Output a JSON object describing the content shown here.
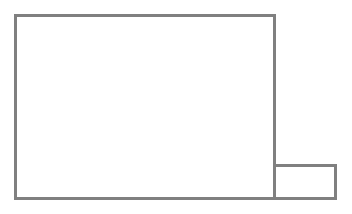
{
  "diagram": {
    "stroke_color": "#808080",
    "stroke_width": 3,
    "shapes": [
      {
        "name": "large-rectangle",
        "x": 14,
        "y": 14,
        "width": 262,
        "height": 186
      },
      {
        "name": "small-rectangle",
        "x": 273,
        "y": 164,
        "width": 64,
        "height": 36
      }
    ]
  }
}
